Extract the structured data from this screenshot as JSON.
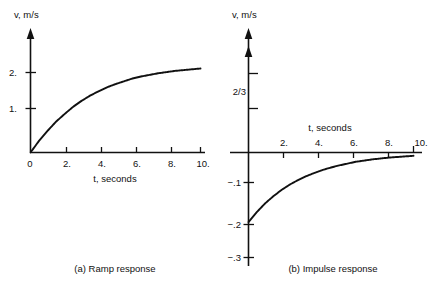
{
  "figure": {
    "title": "",
    "panels": [
      {
        "id": "a",
        "caption": "(a) Ramp response",
        "y_axis_label": "v, m/s",
        "x_axis_label": "t, seconds",
        "x_ticks": [
          "0",
          "2.",
          "4.",
          "6.",
          "8.",
          "10."
        ],
        "y_ticks": [
          "1.",
          "2."
        ]
      },
      {
        "id": "b",
        "caption": "(b) Impulse response",
        "y_axis_label": "v, m/s",
        "x_axis_label": "t, seconds",
        "x_ticks": [
          "2.",
          "4.",
          "6.",
          "8.",
          "10."
        ],
        "y_ticks_positive": [
          "2/3"
        ],
        "y_ticks_negative": [
          "−.1",
          "−.2",
          "−.3"
        ]
      }
    ]
  },
  "chart_data": [
    {
      "type": "line",
      "panel": "a",
      "title": "(a) Ramp response",
      "xlabel": "t, seconds",
      "ylabel": "v, m/s",
      "xlim": [
        0,
        10.5
      ],
      "ylim": [
        0,
        2.25
      ],
      "xticks": [
        0,
        2,
        4,
        6,
        8,
        10
      ],
      "xticklabels": [
        "0",
        "2.",
        "4.",
        "6.",
        "8.",
        "10."
      ],
      "yticks": [
        1,
        2
      ],
      "yticklabels": [
        "1.",
        "2."
      ],
      "grid": false,
      "legend": "none",
      "equation": "v(t) = 2(1 - e^(-t/3.2))",
      "series": [
        {
          "name": "ramp response",
          "x": [
            0,
            0.5,
            1,
            1.5,
            2,
            2.5,
            3,
            3.5,
            4,
            4.5,
            5,
            5.5,
            6,
            6.5,
            7,
            7.5,
            8,
            8.5,
            9,
            9.5,
            10
          ],
          "y": [
            0,
            0.29,
            0.54,
            0.77,
            0.96,
            1.14,
            1.29,
            1.42,
            1.53,
            1.63,
            1.71,
            1.78,
            1.85,
            1.9,
            1.94,
            1.98,
            2.01,
            2.04,
            2.06,
            2.08,
            2.1
          ]
        }
      ]
    },
    {
      "type": "line",
      "panel": "b",
      "title": "(b) Impulse response",
      "xlabel": "t, seconds",
      "ylabel": "v, m/s",
      "xlim": [
        0,
        10.5
      ],
      "ylim": [
        -0.3,
        0.8
      ],
      "xticks": [
        2,
        4,
        6,
        8,
        10
      ],
      "xticklabels": [
        "2.",
        "4.",
        "6.",
        "8.",
        "10."
      ],
      "yticks": [
        -0.3,
        -0.2,
        -0.1,
        0.667
      ],
      "yticklabels": [
        "−.3",
        "−.2",
        "−.1",
        "2/3"
      ],
      "grid": false,
      "legend": "none",
      "annotation": "impulse (double arrowhead) at t = 0 on v axis",
      "equation": "v(t) = -0.23 e^(-t/3.2)",
      "series": [
        {
          "name": "impulse response",
          "x": [
            0,
            0.5,
            1,
            1.5,
            2,
            2.5,
            3,
            3.5,
            4,
            4.5,
            5,
            5.5,
            6,
            6.5,
            7,
            7.5,
            8,
            8.5,
            9,
            9.5,
            10
          ],
          "y": [
            -0.232,
            -0.199,
            -0.17,
            -0.146,
            -0.125,
            -0.107,
            -0.092,
            -0.079,
            -0.068,
            -0.058,
            -0.05,
            -0.043,
            -0.037,
            -0.031,
            -0.027,
            -0.023,
            -0.02,
            -0.017,
            -0.015,
            -0.013,
            -0.011
          ]
        }
      ]
    }
  ],
  "colors": {
    "ink": "#111111",
    "background": "#ffffff"
  }
}
